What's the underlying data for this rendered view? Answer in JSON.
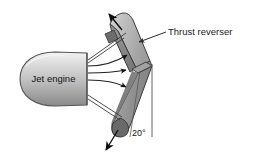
{
  "figure": {
    "name": "jet-engine-thrust-reverser-diagram",
    "background_color": "#ffffff",
    "width": 253,
    "height": 158
  },
  "engine": {
    "label": "Jet engine",
    "shape": "ellipse-nacelle",
    "fill_light": "#e8e8e8",
    "fill_mid": "#c9c9c9",
    "fill_dark": "#9a9a9a",
    "outline_color": "#4a4a4a"
  },
  "reverser": {
    "label": "Thrust reverser",
    "panel_face_color": "#b8b8b8",
    "panel_side_color": "#8c8c8c",
    "panel_edge_color": "#6e6e6e",
    "outline_color": "#3c3c3c",
    "upper_panel_name": "upper-reverser-panel",
    "lower_panel_name": "lower-reverser-panel"
  },
  "angle": {
    "value": "20°",
    "reference": "vertical-reference-line",
    "line_color": "#555555"
  },
  "flow": {
    "name": "exhaust-flow-streamlines",
    "stream_count": 3,
    "arrow_color": "#111111",
    "line_color": "#3a3a3a",
    "deflected_up_arrow": "upward-deflected-thrust-arrow",
    "deflected_down_arrow": "downward-deflected-thrust-arrow"
  },
  "leader": {
    "name": "thrust-reverser-leader-line",
    "color": "#2b2b2b"
  }
}
